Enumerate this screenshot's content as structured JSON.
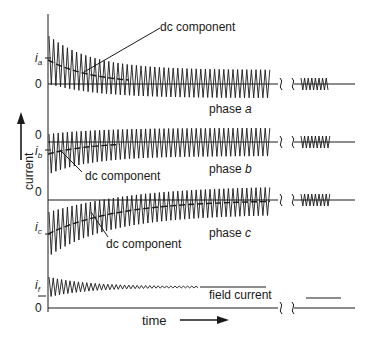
{
  "diagram": {
    "y_axis_label": "current",
    "x_axis_label": "time",
    "traces": [
      {
        "id": "phase-a",
        "label_prefix": "phase ",
        "label_var": "a",
        "symbol": "i",
        "symbol_sub": "a",
        "zero_label": "0",
        "dc_label": "dc component",
        "dc_offset": "positive, decaying"
      },
      {
        "id": "phase-b",
        "label_prefix": "phase ",
        "label_var": "b",
        "symbol": "i",
        "symbol_sub": "b",
        "zero_label": "0",
        "dc_label": "dc component",
        "dc_offset": "negative, decaying"
      },
      {
        "id": "phase-c",
        "label_prefix": "phase ",
        "label_var": "c",
        "symbol": "i",
        "symbol_sub": "c",
        "zero_label": "0",
        "dc_label": "dc component",
        "dc_offset": "negative, decaying"
      },
      {
        "id": "field",
        "label": "field current",
        "symbol": "i",
        "symbol_sub": "f",
        "zero_label": "0"
      }
    ],
    "colors": {
      "ink": "#1a1a1a",
      "background": "#ffffff"
    }
  }
}
